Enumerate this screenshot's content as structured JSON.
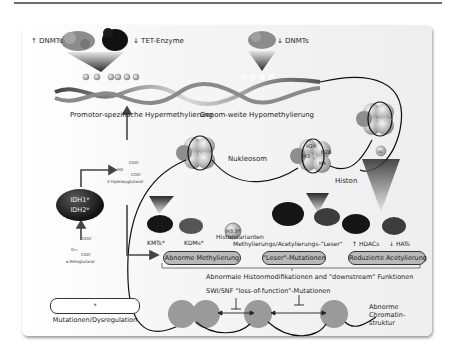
{
  "figure": {
    "top_left": {
      "arrow": "↑",
      "label": "DNMTs"
    },
    "top_tet": {
      "arrow": "↓",
      "label": "TET-Enzyme"
    },
    "top_right": {
      "arrow": "↓",
      "label": "DNMTs"
    },
    "methyl_mark": "Me",
    "label_hyper": "Promotor-spezifische Hypermethylierung",
    "label_hypo": "Genom-weite Hypomethylierung",
    "nucleosome": "Nukleosom",
    "histone": {
      "label": "Histon",
      "subunits": [
        "H2A",
        "H3",
        "H2B",
        "H4"
      ]
    },
    "acetyl_mark": "Ac",
    "metabolites": {
      "two_hg_group1": "COO⁻",
      "two_hg_group2": "HO",
      "two_hg_group3": "COO⁻",
      "two_hg": "2-Hydroxyglutarat",
      "akg_group1": "COO⁻",
      "akg_group2": "O=",
      "akg_group3": "COO⁻",
      "akg": "α-Ketoglutarat"
    },
    "idh": {
      "line1": "IDH1*",
      "line2": "IDH2*"
    },
    "enzymes": {
      "kmts": "KMTs*",
      "kdms": "KDMs*",
      "h33": "H3.3*",
      "histone_variants": "Histonvarianten",
      "readers": "Methylierungs/Acetylierungs-\"Leser\"",
      "hdacs": {
        "arrow": "↑",
        "label": "HDACs"
      },
      "hats": {
        "arrow": "↓",
        "label": "HATs"
      }
    },
    "pills": [
      {
        "label": "Abnorme Methylierung"
      },
      {
        "label": "\"Leser\"-Mutationen"
      },
      {
        "label": "Reduzierte Acetylierung"
      }
    ],
    "label_histmod": "Abnormale Histonmodifikationen and \"downstream\" Funktionen",
    "label_swisnf": "SWI/SNF \"loss-of-function\"-Mutationen",
    "label_chromatin": [
      "Abnorme",
      "Chromatin-",
      "struktur"
    ],
    "legend": "* Mutationen/Dysregulation"
  }
}
